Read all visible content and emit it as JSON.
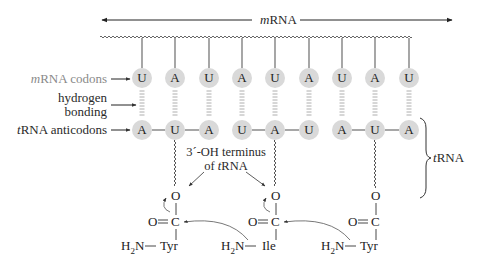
{
  "mrna": {
    "label_prefix": "m",
    "label_suffix": "RNA",
    "codons": [
      "U",
      "A",
      "U",
      "A",
      "U",
      "A",
      "U",
      "A",
      "U"
    ]
  },
  "labels": {
    "mrna_codons_prefix": "m",
    "mrna_codons_suffix": "RNA codons",
    "hydrogen": "hydrogen",
    "bonding": "bonding",
    "trna_anticodons_prefix": "t",
    "trna_anticodons_suffix": "RNA anticodons",
    "terminus_line1": "3´-OH terminus",
    "terminus_line2_prefix": "of ",
    "terminus_line2_ital": "t",
    "terminus_line2_suffix": "RNA",
    "trna_brace_prefix": "t",
    "trna_brace_suffix": "RNA"
  },
  "trna": {
    "anticodons": [
      "A",
      "U",
      "A",
      "U",
      "A",
      "U",
      "A",
      "U",
      "A"
    ],
    "groups": [
      {
        "bases": "AUA",
        "amino_acid": "Tyr"
      },
      {
        "bases": "UAU",
        "amino_acid": "Ile"
      },
      {
        "bases": "AUA",
        "amino_acid": "Tyr"
      }
    ]
  },
  "chemistry": {
    "oxygen": "O",
    "carbonyl": "O",
    "carbon": "C",
    "amine_h": "H",
    "amine_sub": "2",
    "amine_n": "N",
    "aa1": "Tyr",
    "aa2": "Ile",
    "aa3": "Tyr"
  },
  "colors": {
    "base_fill": "#d9d9d9",
    "line": "#333333",
    "gray_text": "#8a8a8a"
  }
}
